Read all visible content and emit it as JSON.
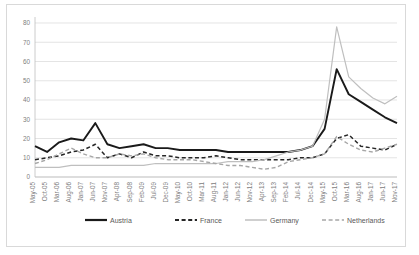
{
  "chart_data": {
    "type": "line",
    "title": "",
    "xlabel": "",
    "ylabel": "",
    "ylim": [
      0,
      80
    ],
    "yticks": [
      0,
      10,
      20,
      30,
      40,
      50,
      60,
      70,
      80
    ],
    "grid": true,
    "legend_position": "bottom",
    "categories": [
      "May-05",
      "Oct-05",
      "Mar-06",
      "Aug-06",
      "Jan-07",
      "Jun-07",
      "Nov-07",
      "Apr-08",
      "Sep-08",
      "Feb-09",
      "Jul-09",
      "Dec-09",
      "May-10",
      "Oct-10",
      "Mar-11",
      "Aug-11",
      "Jan-12",
      "Jun-12",
      "Nov-12",
      "Apr-13",
      "Sep-13",
      "Feb-14",
      "Jul-14",
      "Dec-14",
      "May-15",
      "Oct-15",
      "Mar-16",
      "Aug-16",
      "Jan-17",
      "Jun-17",
      "Nov-17"
    ],
    "series": [
      {
        "name": "Austria",
        "color": "#1a1a1a",
        "dash": "none",
        "width": 1.9,
        "values": [
          16,
          13,
          18,
          20,
          19,
          28,
          17,
          15,
          16,
          17,
          15,
          15,
          14,
          14,
          14,
          14,
          13,
          13,
          13,
          13,
          13,
          13,
          14,
          16,
          25,
          56,
          43,
          39,
          35,
          31,
          28
        ]
      },
      {
        "name": "France",
        "color": "#262626",
        "dash": "dashed",
        "width": 1.5,
        "values": [
          9,
          10,
          11,
          13,
          14,
          17,
          10,
          12,
          10,
          13,
          11,
          11,
          10,
          10,
          10,
          11,
          10,
          9,
          9,
          9,
          9,
          9,
          10,
          10,
          12,
          20,
          22,
          16,
          15,
          14,
          17
        ]
      },
      {
        "name": "Germany",
        "color": "#bfbfbf",
        "dash": "none",
        "width": 1.2,
        "values": [
          5,
          5,
          5,
          6,
          6,
          6,
          6,
          6,
          6,
          6,
          7,
          7,
          7,
          7,
          7,
          7,
          8,
          8,
          8,
          9,
          11,
          13,
          14,
          16,
          30,
          78,
          52,
          46,
          41,
          38,
          42
        ]
      },
      {
        "name": "Netherlands",
        "color": "#a6a6a6",
        "dash": "dashed",
        "width": 1.4,
        "values": [
          7,
          9,
          12,
          15,
          12,
          10,
          10,
          12,
          11,
          12,
          10,
          9,
          9,
          9,
          8,
          7,
          6,
          6,
          5,
          4,
          5,
          8,
          9,
          10,
          12,
          21,
          17,
          14,
          13,
          15,
          17
        ]
      }
    ]
  },
  "legend": {
    "items": [
      {
        "label": "Austria"
      },
      {
        "label": "France"
      },
      {
        "label": "Germany"
      },
      {
        "label": "Netherlands"
      }
    ]
  }
}
